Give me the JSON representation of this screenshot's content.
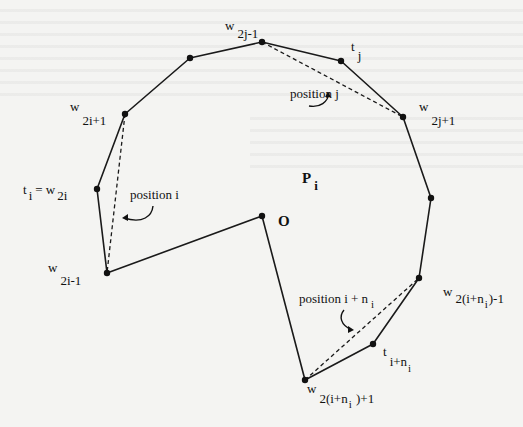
{
  "figure": {
    "type": "polygon-diagram",
    "polygon_vertices": [
      {
        "id": "w2j-1",
        "x": 262,
        "y": 42
      },
      {
        "id": "tj",
        "x": 341,
        "y": 61
      },
      {
        "id": "w2j+1",
        "x": 403,
        "y": 117
      },
      {
        "id": "v_right",
        "x": 431,
        "y": 198
      },
      {
        "id": "w2(i+ni)-1",
        "x": 419,
        "y": 278
      },
      {
        "id": "t_i+ni",
        "x": 373,
        "y": 344
      },
      {
        "id": "w2(i+ni)+1",
        "x": 305,
        "y": 380
      },
      {
        "id": "O",
        "x": 262,
        "y": 216
      },
      {
        "id": "w2i-1",
        "x": 107,
        "y": 273
      },
      {
        "id": "ti=w2i",
        "x": 97,
        "y": 189
      },
      {
        "id": "w2i+1",
        "x": 125,
        "y": 114
      },
      {
        "id": "v_topleft",
        "x": 190,
        "y": 58
      }
    ],
    "dashed_chords": [
      {
        "from": "w2j-1",
        "to": "w2j+1"
      },
      {
        "from": "w2i+1",
        "to": "w2i-1"
      },
      {
        "from": "w2(i+ni)+1",
        "to": "w2(i+ni)-1"
      }
    ],
    "labels": {
      "w2j_1": {
        "main": "w",
        "sub": "2j-1"
      },
      "tj": {
        "main": "t",
        "sub": "j"
      },
      "w2j_plus1": {
        "main": "w",
        "sub": "2j+1"
      },
      "w2i_plus1": {
        "main": "w",
        "sub": "2i+1"
      },
      "ti": {
        "main": "t",
        "sub": "i",
        "eq": "= w",
        "eq_sub": "2i"
      },
      "w2i_1": {
        "main": "w",
        "sub": "2i-1"
      },
      "O": "O",
      "Pi": {
        "main": "P",
        "sub": "i"
      },
      "w2ini_1": {
        "main": "w",
        "sub": "2(i+n",
        "sub2": "i",
        "sub3": ")-1"
      },
      "tini": {
        "main": "t",
        "sub": "i+n",
        "sub2": "i"
      },
      "w2ini_plus1": {
        "main": "w",
        "sub": "2(i+n",
        "sub2": "i",
        "sub3": " )+1"
      }
    },
    "annotations": {
      "position_j": "position j",
      "position_i": "position i",
      "position_ini": "position i + n",
      "position_ini_sub": "i"
    }
  }
}
